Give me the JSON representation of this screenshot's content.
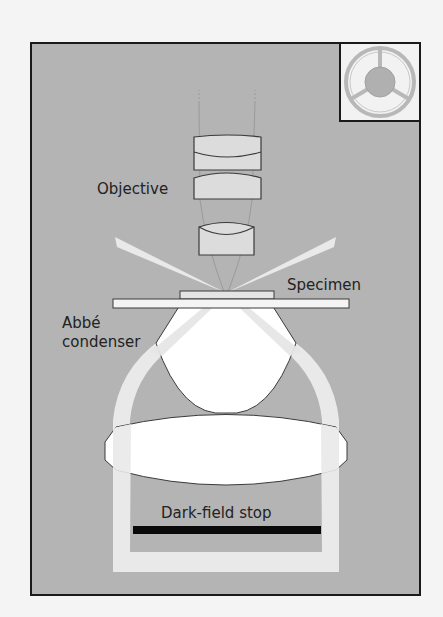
{
  "diagram": {
    "labels": {
      "objective": "Objective",
      "specimen": "Specimen",
      "condenser_line1": "Abbé",
      "condenser_line2": "condenser",
      "stop": "Dark-field stop"
    },
    "inset": {
      "description": "Dark-field stop (top view)",
      "icon": "dark-field-stop-disc-icon"
    },
    "colors": {
      "page_background": "#f4f4f4",
      "frame_background": "#b4b4b4",
      "frame_border": "#1a1a1a",
      "inset_background": "#f2f2f2",
      "light_beam": "#e9e9e9",
      "lens_fill": "#dcdcdc",
      "condenser_lens_fill": "#ffffff",
      "lens_outline": "#3a3a3a",
      "stop_bar": "#0a0a0a",
      "inset_ring": "#b8b8b8",
      "text": "#222222"
    }
  }
}
